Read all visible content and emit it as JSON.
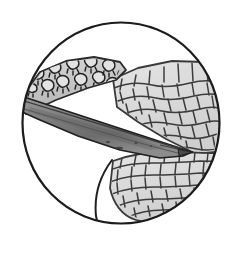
{
  "figure": {
    "title": "Circular endoscopic illustration of tissue dissection",
    "style": "grayscale line illustration",
    "background_color": "#ffffff"
  },
  "frame": {
    "name": "circular field of view",
    "shape": "circle",
    "center_x": 121,
    "center_y": 123,
    "radius_x": 99,
    "radius_y": 101,
    "stroke_color": "#1c1c1c",
    "stroke_width": 2.2,
    "fill_color": "#ffffff"
  },
  "regions": [
    {
      "id": "papillated-band",
      "label": "papillated mucosal band",
      "fill_color": "#c9c9c9",
      "stroke_color": "#2a2a2a",
      "texture": "rounded papillae with short basal projections",
      "papilla_count": 13,
      "location": "upper left, oblique band"
    },
    {
      "id": "instrument-blade",
      "label": "tapered dissecting instrument",
      "fill_color": "#8a8a8a",
      "fill_color_dark": "#6a6a6a",
      "stroke_color": "#1f1f1f",
      "texture": "smooth shaded wedge tapering to a point",
      "tip_x": 192,
      "tip_y": 152,
      "location": "diagonal from left edge to right center"
    },
    {
      "id": "cobblestone-tissue-upper",
      "label": "cobblestone submucosal tissue (upper)",
      "fill_color": "#dcdcdc",
      "stroke_color": "#3a3a3a",
      "texture": "polygonal scale / cobblestone cells",
      "cell_count": 62,
      "location": "right upper quadrant"
    },
    {
      "id": "cobblestone-tissue-lower",
      "label": "cobblestone submucosal tissue (lower)",
      "fill_color": "#dcdcdc",
      "stroke_color": "#3a3a3a",
      "texture": "polygonal scale / cobblestone cells",
      "cell_count": 44,
      "location": "right lower quadrant"
    },
    {
      "id": "cleared-lumen",
      "label": "cleared lumen / dissected plane",
      "fill_color": "#ffffff",
      "stroke_color": "#1c1c1c",
      "texture": "blank white",
      "location": "lower left quadrant"
    },
    {
      "id": "upper-lumen",
      "label": "open lumen above tissue",
      "fill_color": "#ffffff",
      "stroke_color": "#1c1c1c",
      "texture": "blank white",
      "location": "upper portion of circle"
    }
  ],
  "palette": {
    "outline": "#1c1c1c",
    "mid_gray": "#8a8a8a",
    "light_gray": "#dcdcdc",
    "band_gray": "#c9c9c9",
    "white": "#ffffff"
  }
}
